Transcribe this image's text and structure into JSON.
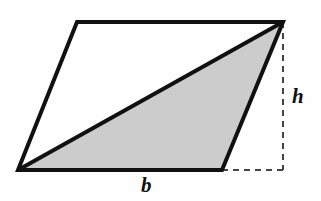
{
  "figure": {
    "kind": "geometry-diagram",
    "canvas": {
      "width": 321,
      "height": 201
    },
    "background_color": "#fefefe",
    "stroke_color": "#111111",
    "stroke_width": 4,
    "shade_color": "#cccccc",
    "dash_color": "#444444",
    "dash_width": 2,
    "dash_pattern": "6,5"
  },
  "shapes": {
    "parallelogram": {
      "name": "parallelogram",
      "fill": "#fefefe",
      "points": "77,22 283,22 222,170 18,170",
      "vertices": [
        {
          "id": "top-left",
          "x": 77,
          "y": 22
        },
        {
          "id": "top-right",
          "x": 283,
          "y": 22
        },
        {
          "id": "bottom-right",
          "x": 222,
          "y": 170
        },
        {
          "id": "bottom-left",
          "x": 18,
          "y": 170
        }
      ]
    },
    "shaded_triangle": {
      "name": "shaded-triangle",
      "fill": "#cccccc",
      "points": "18,170 222,170 283,22",
      "vertices": [
        {
          "id": "bottom-left",
          "x": 18,
          "y": 170
        },
        {
          "id": "bottom-right",
          "x": 222,
          "y": 170
        },
        {
          "id": "top-right",
          "x": 283,
          "y": 22
        }
      ]
    },
    "diagonal": {
      "name": "diagonal-line",
      "x1": 18,
      "y1": 170,
      "x2": 283,
      "y2": 22
    }
  },
  "dashed_lines": {
    "height_line": {
      "name": "height-dashed-line",
      "x1": 283,
      "y1": 22,
      "x2": 283,
      "y2": 170
    },
    "base_extension_line": {
      "name": "base-extension-dashed-line",
      "x1": 222,
      "y1": 170,
      "x2": 285,
      "y2": 170
    }
  },
  "labels": {
    "height": {
      "text": "h",
      "meaning": "height",
      "x": 299,
      "y": 97
    },
    "base": {
      "text": "b",
      "meaning": "base",
      "x": 148,
      "y": 186
    }
  }
}
